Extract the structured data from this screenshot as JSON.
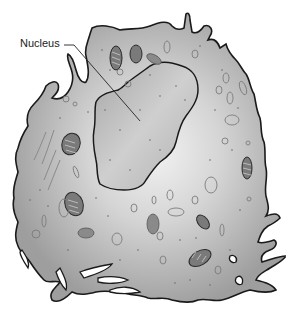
{
  "diagram": {
    "type": "cell-illustration",
    "labels": [
      {
        "id": "nucleus",
        "text": "Nucleus",
        "x": 20,
        "y": 37
      }
    ],
    "colors": {
      "cytoplasm": "#a9a9a9",
      "cytoplasm_light": "#e8e8e8",
      "nucleus": "#b4b4b4",
      "outline": "#1a1a1a",
      "organelle": "#8c8c8c",
      "background": "#ffffff"
    },
    "structures": [
      "cell-membrane",
      "cytoplasm",
      "nucleus",
      "mitochondria",
      "vesicles",
      "endoplasmic-reticulum"
    ]
  }
}
